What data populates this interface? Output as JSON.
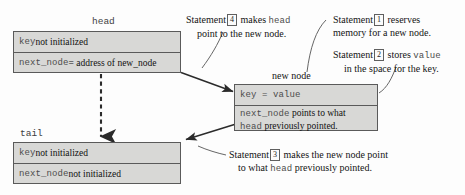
{
  "diagram": {
    "colors": {
      "box_fill": "#d8d8d6",
      "box_border": "#5a5a5a",
      "text": "#111111",
      "mono_text": "#4c4c4c",
      "arrow": "#2b2b2b",
      "leader": "#555555",
      "background": "#fdfdfd"
    },
    "nodes": {
      "head": {
        "label": "head",
        "rows": [
          {
            "mono": "key",
            "rest": " not initialized"
          },
          {
            "mono": "next_node",
            "rest": " = address of new_node"
          }
        ]
      },
      "tail": {
        "label": "tail",
        "rows": [
          {
            "mono": "key",
            "rest": " not initialized"
          },
          {
            "mono": "next_node",
            "rest": " not initialized"
          }
        ]
      },
      "new_node": {
        "label": "new node",
        "rows": [
          {
            "mono": "key = value",
            "rest": ""
          },
          {
            "mono": "next_node",
            "rest": " points to what"
          },
          {
            "mono": "head",
            "rest": " previously pointed."
          }
        ]
      }
    },
    "captions": {
      "statement4": {
        "prefix": "Statement",
        "number": "4",
        "mid": " makes ",
        "mono": "head",
        "line2": "point to the new node."
      },
      "statement1": {
        "prefix": "Statement",
        "number": "1",
        "mid": " reserves",
        "line2": "memory for a new node."
      },
      "statement2": {
        "prefix": "Statement",
        "number": "2",
        "mid": " stores ",
        "mono": "value",
        "line2": "in the space for the key."
      },
      "statement3": {
        "prefix": "Statement",
        "number": "3",
        "mid": " makes the new node point",
        "line2_pre": "to what ",
        "line2_mono": "head",
        "line2_post": " previously pointed."
      }
    },
    "connectors": [
      {
        "name": "head-to-new-node",
        "style": "solid-arrow"
      },
      {
        "name": "new-node-to-tail",
        "style": "solid-arrow"
      },
      {
        "name": "head-to-tail",
        "style": "dashed-arrow"
      },
      {
        "name": "statement4-leader",
        "style": "curve"
      },
      {
        "name": "statement1-leader",
        "style": "curve"
      },
      {
        "name": "statement2-leader",
        "style": "curve"
      },
      {
        "name": "statement3-leader",
        "style": "curve"
      }
    ]
  }
}
